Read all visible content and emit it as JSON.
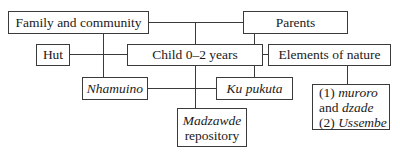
{
  "diagram": {
    "nodes": {
      "family": {
        "label": "Family and community"
      },
      "parents": {
        "label": "Parents"
      },
      "hut": {
        "label": "Hut"
      },
      "child": {
        "label": "Child 0–2 years"
      },
      "nature": {
        "label": "Elements of nature"
      },
      "nhamuino": {
        "label": "Nhamuino"
      },
      "kupukuta": {
        "label": "Ku pukuta"
      },
      "madzawde": {
        "line1": "Madzawde",
        "line2": "repository"
      },
      "nature_items": {
        "item1_prefix": "(1) ",
        "item1_term": "muroro",
        "item1_and": "and ",
        "item1_term2": "dzade",
        "item2_prefix": "(2) ",
        "item2_term": "Ussembe"
      }
    },
    "edges": [
      {
        "from": "family",
        "to": "parents"
      },
      {
        "from": "family",
        "to": "nhamuino"
      },
      {
        "from": "hut",
        "to": "child"
      },
      {
        "from": "child",
        "to": "nature"
      },
      {
        "from": "parents",
        "to": "kupukuta"
      },
      {
        "from": "nhamuino",
        "to": "kupukuta"
      },
      {
        "from": "family-parents-link",
        "to": "madzawde"
      },
      {
        "from": "nature",
        "to": "nature_items"
      }
    ],
    "colors": {
      "line": "#3a3a3a",
      "box_border": "#3a3a3a",
      "background": "#ffffff",
      "text": "#1a1a1a"
    }
  }
}
